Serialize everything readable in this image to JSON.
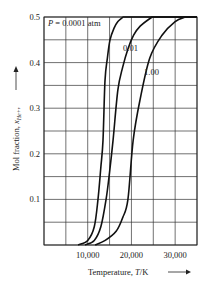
{
  "chart_data": {
    "type": "line",
    "title": "",
    "xlabel": "Temperature, T/K",
    "ylabel": "Mol fraction, x_He+",
    "xlim": [
      0,
      35000
    ],
    "ylim": [
      0,
      0.5
    ],
    "grid": true,
    "x_grid_step": 5000,
    "y_grid_step": 0.05,
    "x_ticks": [
      10000,
      20000,
      30000
    ],
    "x_tick_labels": [
      "10,000",
      "20,000",
      "30,000"
    ],
    "y_ticks": [
      0.1,
      0.2,
      0.3,
      0.4,
      0.5
    ],
    "y_tick_labels": [
      "0.1",
      "0.2",
      "0.3",
      "0.4",
      "0.5"
    ],
    "legend": "none (curves labeled inline)",
    "series": [
      {
        "name": "P = 0.0001 atm",
        "label": "P = 0.0001 atm",
        "x": [
          7800,
          10000,
          11500,
          12350,
          13000,
          13500,
          13950,
          14500,
          15100,
          16000,
          16900,
          18100
        ],
        "y": [
          0.0,
          0.01,
          0.04,
          0.1,
          0.17,
          0.23,
          0.36,
          0.41,
          0.45,
          0.475,
          0.49,
          0.5
        ]
      },
      {
        "name": "P = 0.01 atm",
        "label": "0.01",
        "x": [
          9400,
          11500,
          13000,
          14200,
          15000,
          15800,
          16900,
          18000,
          19200,
          20500,
          22000,
          24700
        ],
        "y": [
          0.0,
          0.01,
          0.04,
          0.1,
          0.16,
          0.23,
          0.34,
          0.39,
          0.43,
          0.46,
          0.48,
          0.5
        ]
      },
      {
        "name": "P = 1.00 atm",
        "label": "1.00",
        "x": [
          11700,
          14000,
          16500,
          18000,
          19200,
          20400,
          22000,
          24200,
          27000,
          30000,
          32300
        ],
        "y": [
          0.0,
          0.01,
          0.03,
          0.06,
          0.1,
          0.23,
          0.32,
          0.41,
          0.46,
          0.49,
          0.5
        ]
      }
    ],
    "annotations": [
      {
        "text": "P = 0.0001 atm",
        "x": 2000,
        "y": 0.485
      },
      {
        "text": "0.01",
        "x": 17200,
        "y": 0.43
      },
      {
        "text": "1.00",
        "x": 21000,
        "y": 0.39
      }
    ]
  },
  "labels": {
    "x_axis_title": "Temperature, ",
    "x_axis_var": "T",
    "x_axis_unit": "/K",
    "y_axis_title": "Mol fraction, ",
    "y_axis_var": "x",
    "y_axis_sub": "He+",
    "y_axis_comma": ",",
    "curve1_label_prefix": "P",
    "curve1_label_rest": " = 0.0001 atm",
    "curve2_label": "0.01",
    "curve3_label": "1.00"
  },
  "colors": {
    "curve": "#111111",
    "grid": "#333333",
    "background": "#ffffff"
  }
}
